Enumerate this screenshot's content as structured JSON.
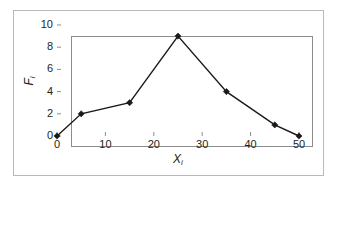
{
  "chart_data": {
    "type": "line",
    "title": "",
    "subtitle": "",
    "xlabel": "X",
    "xlabel_subscript": "i",
    "ylabel": "F",
    "ylabel_subscript": "i",
    "x": [
      0,
      5,
      15,
      25,
      35,
      45,
      50
    ],
    "values": [
      0,
      2,
      3,
      9,
      4,
      1,
      0
    ],
    "series": [
      {
        "name": "",
        "x": [
          0,
          5,
          15,
          25,
          35,
          45,
          50
        ],
        "values": [
          0,
          2,
          3,
          9,
          4,
          1,
          0
        ],
        "marker": "diamond",
        "color": "#1a1a1a"
      }
    ],
    "xlim": [
      0,
      50
    ],
    "ylim": [
      0,
      10
    ],
    "xticks": [
      0,
      10,
      20,
      30,
      40,
      50
    ],
    "yticks": [
      0,
      2,
      4,
      6,
      8,
      10
    ],
    "xtick_labels": [
      "0",
      "10",
      "20",
      "30",
      "40",
      "50"
    ],
    "ytick_labels": [
      "0",
      "2",
      "4",
      "6",
      "8",
      "10"
    ],
    "grid": false,
    "legend": false,
    "legend_position": "none",
    "tick_direction": "in",
    "annotations": [],
    "colors": {
      "line": "#1a1a1a",
      "marker": "#1a1a1a",
      "plot_border": "#8d8d8f",
      "frame_border": "#b9b9bb",
      "background": "#ffffff",
      "text": "#231f20"
    }
  }
}
